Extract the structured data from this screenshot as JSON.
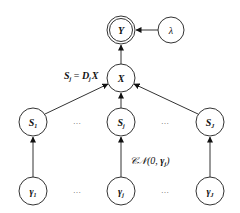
{
  "diagram": {
    "type": "graphical-model",
    "nodes": {
      "Y": {
        "label": "Y",
        "sub": "",
        "kind": "observed-double-circle"
      },
      "lambda": {
        "label": "λ",
        "sub": "",
        "kind": "latent"
      },
      "X": {
        "label": "X",
        "sub": "",
        "kind": "latent"
      },
      "S1": {
        "label": "S",
        "sub": "1",
        "kind": "latent"
      },
      "Sj": {
        "label": "S",
        "sub": "j",
        "kind": "latent"
      },
      "SJ": {
        "label": "S",
        "sub": "J",
        "kind": "latent"
      },
      "g1": {
        "label": "γ",
        "sub": "1",
        "kind": "latent"
      },
      "gj": {
        "label": "γ",
        "sub": "j",
        "kind": "latent"
      },
      "gJ": {
        "label": "γ",
        "sub": "J",
        "kind": "latent"
      }
    },
    "edges": [
      {
        "from": "lambda",
        "to": "Y"
      },
      {
        "from": "X",
        "to": "Y"
      },
      {
        "from": "S1",
        "to": "X"
      },
      {
        "from": "Sj",
        "to": "X"
      },
      {
        "from": "SJ",
        "to": "X"
      },
      {
        "from": "g1",
        "to": "S1"
      },
      {
        "from": "gj",
        "to": "Sj"
      },
      {
        "from": "gJ",
        "to": "SJ"
      }
    ],
    "annotations": {
      "relation": {
        "S": "S",
        "S_sub": "j",
        "eq": " = ",
        "D": "D",
        "D_sub": "j",
        "X": "X"
      },
      "prior": {
        "prefix": "𝒞𝒩(0, ",
        "gamma": "γ",
        "gamma_sub": "j",
        "suffix": ")"
      }
    },
    "ellipsis": "…"
  }
}
